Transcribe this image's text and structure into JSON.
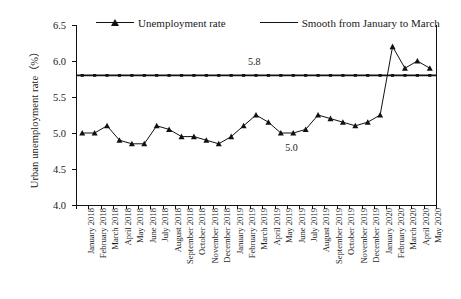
{
  "chart_data": {
    "type": "line",
    "title": "",
    "xlabel": "",
    "ylabel": "Urban unemployment rate (%)",
    "ylim": [
      4.0,
      6.5
    ],
    "ytick_labels": [
      "6.5",
      "6.0",
      "5.5",
      "5.0",
      "4.5",
      "4.0"
    ],
    "ytick_values": [
      6.5,
      6.0,
      5.5,
      5.0,
      4.5,
      4.0
    ],
    "grid": false,
    "legend_position": "top",
    "categories": [
      "January 2018",
      "February 2018",
      "March 2018",
      "April 2018",
      "May 2018",
      "June 2018",
      "July 2018",
      "August 2018",
      "September 2018",
      "October 2018",
      "November 2018",
      "December 2018",
      "January 2019",
      "February 2019",
      "March 2019",
      "April 2019",
      "May 2019",
      "June 2019",
      "July 2019",
      "August 2019",
      "September 2019",
      "October 2019",
      "November 2019",
      "December 2019",
      "January 2020",
      "February 2020",
      "March 2020",
      "April 2020",
      "May 2020"
    ],
    "series": [
      {
        "name": "Unemployment rate",
        "marker": "triangle",
        "values": [
          5.0,
          5.0,
          5.1,
          4.9,
          4.85,
          4.85,
          5.1,
          5.05,
          4.95,
          4.95,
          4.9,
          4.85,
          4.95,
          5.1,
          5.25,
          5.15,
          5.0,
          5.0,
          5.05,
          5.25,
          5.2,
          5.15,
          5.1,
          5.15,
          5.25,
          6.2,
          5.9,
          6.0,
          5.9
        ]
      },
      {
        "name": "Smooth from January to March",
        "marker": "none",
        "constant": 5.8
      }
    ],
    "annotations": [
      {
        "text": "5.8",
        "x_index": 14,
        "y_value": 5.97
      },
      {
        "text": "5.0",
        "x_index": 17,
        "y_value": 4.78
      }
    ]
  },
  "legend": {
    "items": [
      {
        "label": "Unemployment rate",
        "marker": "triangle-marker"
      },
      {
        "label": "Smooth from January to March",
        "marker": "plain-line"
      }
    ]
  },
  "axis": {
    "y_title": "Urban unemployment rate（%）"
  }
}
